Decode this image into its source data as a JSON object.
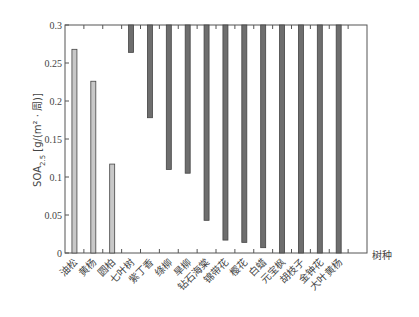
{
  "chart_data": {
    "type": "bar",
    "title": "",
    "xlabel": "树种",
    "ylabel": "SOA2.5 [g/(m²·周)]",
    "ylim": [
      0,
      0.3
    ],
    "yticks": [
      0,
      0.05,
      0.1,
      0.15,
      0.2,
      0.25,
      0.3
    ],
    "ytick_labels": [
      "0",
      "0.05",
      "0.1",
      "0.15",
      "0.2",
      "0.25",
      "0.3"
    ],
    "grid": false,
    "legend": null,
    "categories": [
      "油松",
      "黄杨",
      "圆柏",
      "七叶树",
      "紫丁香",
      "绦柳",
      "旱柳",
      "钻石海棠",
      "锦带花",
      "樱花",
      "白蜡",
      "元宝枫",
      "胡枝子",
      "金钟花",
      "大叶黄杨"
    ],
    "note": "Light bars rise from 0; dark bars hang down from 0.3 (value = bottom edge).",
    "values": [
      0.268,
      0.226,
      0.117,
      0.264,
      0.178,
      0.11,
      0.105,
      0.043,
      0.017,
      0.014,
      0.007,
      0.0,
      0.0,
      0.0,
      0.0
    ],
    "bar_style": [
      "up",
      "up",
      "up",
      "down",
      "down",
      "down",
      "down",
      "down",
      "down",
      "down",
      "down",
      "down",
      "down",
      "down",
      "down"
    ],
    "colors": {
      "light": "#c8c8c8",
      "dark": "#6e6e6e",
      "edge": "#444444"
    }
  },
  "axis": {
    "xlabel": "树种",
    "ylabel_main": "SOA",
    "ylabel_sub": "2.5",
    "ylabel_unit": " [g/(m² · 周)]"
  }
}
